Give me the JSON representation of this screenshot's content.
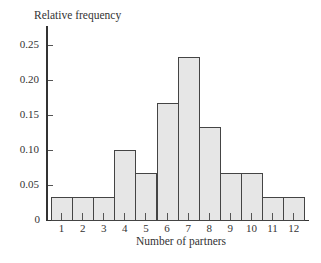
{
  "chart_data": {
    "type": "bar",
    "title": "",
    "xlabel": "Number of partners",
    "ylabel": "Relative frequency",
    "categories": [
      "1",
      "2",
      "3",
      "4",
      "5",
      "6",
      "7",
      "8",
      "9",
      "10",
      "11",
      "12"
    ],
    "values": [
      0.033,
      0.033,
      0.033,
      0.1,
      0.067,
      0.167,
      0.233,
      0.133,
      0.067,
      0.067,
      0.033,
      0.033
    ],
    "yticks": [
      "0",
      "0.05",
      "0.10",
      "0.15",
      "0.20",
      "0.25"
    ],
    "ytick_values": [
      0,
      0.05,
      0.1,
      0.15,
      0.2,
      0.25
    ],
    "ylim": [
      0,
      0.27
    ],
    "grid": false,
    "legend": null,
    "bar_color": "#e6e6e6",
    "edge_color": "#444444"
  }
}
